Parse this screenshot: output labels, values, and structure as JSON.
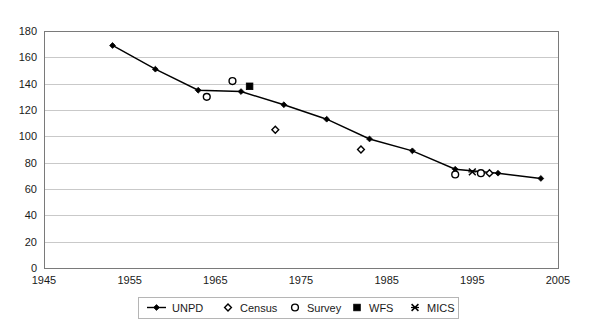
{
  "chart_data": {
    "type": "line",
    "title": "",
    "subtitle": "",
    "xlabel": "",
    "ylabel": "",
    "xlim": [
      1945,
      2005
    ],
    "ylim": [
      0,
      180
    ],
    "x_ticks": [
      1945,
      1955,
      1965,
      1975,
      1985,
      1995,
      2005
    ],
    "y_ticks": [
      0,
      20,
      40,
      60,
      80,
      100,
      120,
      140,
      160,
      180
    ],
    "grid": true,
    "legend_position": "bottom",
    "series": [
      {
        "name": "UNPD",
        "marker": "filled-diamond-line",
        "color": "#000000",
        "points": [
          {
            "x": 1953,
            "y": 169
          },
          {
            "x": 1958,
            "y": 151
          },
          {
            "x": 1963,
            "y": 135
          },
          {
            "x": 1968,
            "y": 134
          },
          {
            "x": 1973,
            "y": 124
          },
          {
            "x": 1978,
            "y": 113
          },
          {
            "x": 1983,
            "y": 98
          },
          {
            "x": 1988,
            "y": 89
          },
          {
            "x": 1993,
            "y": 75
          },
          {
            "x": 1998,
            "y": 72
          },
          {
            "x": 2003,
            "y": 68
          }
        ]
      },
      {
        "name": "Census",
        "marker": "open-diamond",
        "color": "#000000",
        "points": [
          {
            "x": 1972,
            "y": 105
          },
          {
            "x": 1982,
            "y": 90
          },
          {
            "x": 1997,
            "y": 72
          }
        ]
      },
      {
        "name": "Survey",
        "marker": "open-circle",
        "color": "#000000",
        "points": [
          {
            "x": 1964,
            "y": 130
          },
          {
            "x": 1967,
            "y": 142
          },
          {
            "x": 1993,
            "y": 71
          },
          {
            "x": 1996,
            "y": 72
          }
        ]
      },
      {
        "name": "WFS",
        "marker": "filled-square",
        "color": "#000000",
        "points": [
          {
            "x": 1969,
            "y": 138
          }
        ]
      },
      {
        "name": "MICS",
        "marker": "x-star",
        "color": "#000000",
        "points": [
          {
            "x": 1995,
            "y": 73
          }
        ]
      }
    ]
  },
  "legend": {
    "entries": [
      {
        "label": "UNPD",
        "marker": "filled-diamond-line"
      },
      {
        "label": "Census",
        "marker": "open-diamond"
      },
      {
        "label": "Survey",
        "marker": "open-circle"
      },
      {
        "label": "WFS",
        "marker": "filled-square"
      },
      {
        "label": "MICS",
        "marker": "x-star"
      }
    ]
  }
}
